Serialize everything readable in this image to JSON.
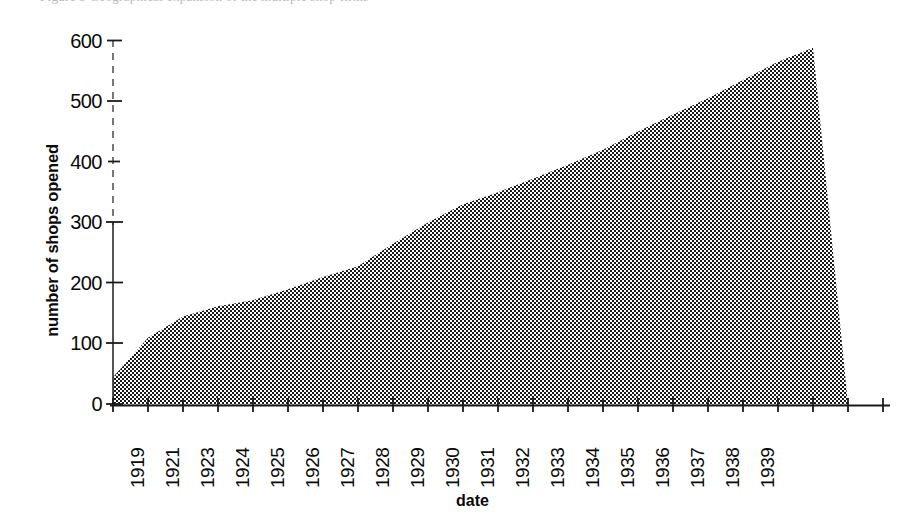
{
  "figure": {
    "caption_sliver": "Figure 3  Geographical expansion of the multiple shop firms"
  },
  "axes": {
    "y_title": "number of shops opened",
    "x_title": "date",
    "y_ticks": [
      0,
      100,
      200,
      300,
      400,
      500,
      600
    ],
    "y_tick_labels": [
      "0",
      "100",
      "200",
      "300",
      "400",
      "500",
      "600"
    ],
    "x_tick_labels": [
      "1919",
      "1921",
      "1923",
      "1924",
      "1925",
      "1926",
      "1927",
      "1928",
      "1929",
      "1930",
      "1931",
      "1932",
      "1933",
      "1934",
      "1935",
      "1936",
      "1937",
      "1938",
      "1939"
    ]
  },
  "chart_data": {
    "type": "area",
    "title": "",
    "subtitle": "",
    "xlabel": "date",
    "ylabel": "number of shops opened",
    "xlim": [
      1919,
      1941.2
    ],
    "ylim": [
      0,
      600
    ],
    "grid": false,
    "legend": null,
    "fill_pattern": "50% checkerboard dither (black on white)",
    "x": [
      1919,
      1920,
      1921,
      1922,
      1923,
      1924,
      1925,
      1926,
      1927,
      1928,
      1929,
      1930,
      1931,
      1932,
      1933,
      1934,
      1935,
      1936,
      1937,
      1938,
      1939,
      1940
    ],
    "values": [
      45,
      110,
      145,
      162,
      172,
      190,
      210,
      228,
      265,
      300,
      330,
      350,
      372,
      395,
      420,
      450,
      478,
      505,
      535,
      565,
      588,
      0
    ],
    "series": [
      {
        "name": "number of shops opened",
        "values": [
          45,
          110,
          145,
          162,
          172,
          190,
          210,
          228,
          265,
          300,
          330,
          350,
          372,
          395,
          420,
          450,
          478,
          505,
          535,
          565,
          588,
          0
        ]
      }
    ],
    "annotations": [
      "Series rises steeply 1919-1923, then climbs steadily to a peak of about 590 in 1939, after which it drops abruptly to 0.",
      "Axis tick labels skip 1920 and 1922; axis extends about two tick intervals past 1939 with unlabelled ticks."
    ],
    "notes": {
      "peak_value": 588,
      "peak_year": 1939,
      "start_value": 45,
      "start_year": 1919
    }
  },
  "colors": {
    "fill": "#808080",
    "ink": "#0a0a0a",
    "background": "#ffffff"
  }
}
